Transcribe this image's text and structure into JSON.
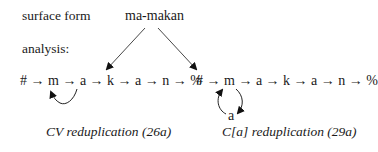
{
  "labels": {
    "surface_form": "surface form",
    "analysis": "analysis:"
  },
  "surface_word": "ma-makan",
  "left": {
    "chain": "# → m → a → k → a → n → %",
    "caption": "CV reduplication (26a)"
  },
  "right": {
    "chain": "# → m → a → k → a → n → %",
    "loop_node": "a",
    "caption": "C[a] reduplication (29a)"
  }
}
